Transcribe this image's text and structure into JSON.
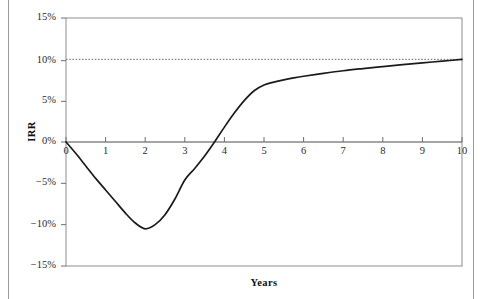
{
  "chart_data": {
    "type": "line",
    "title": "",
    "subtitle": "",
    "xlabel": "Years",
    "ylabel": "IRR",
    "xlim": [
      0,
      10
    ],
    "ylim": [
      -0.15,
      0.15
    ],
    "grid": false,
    "legend": null,
    "x_ticks": [
      0,
      1,
      2,
      3,
      4,
      5,
      6,
      7,
      8,
      9,
      10
    ],
    "x_tick_labels": [
      "0",
      "1",
      "2",
      "3",
      "4",
      "5",
      "6",
      "7",
      "8",
      "9",
      "10"
    ],
    "y_ticks": [
      0.15,
      0.1,
      0.05,
      0.0,
      -0.05,
      -0.1,
      -0.15
    ],
    "y_tick_labels": [
      "15%",
      "10%",
      "5%",
      "0%",
      "−5%",
      "−10%",
      "−15%"
    ],
    "series": [
      {
        "name": "IRR",
        "style": "solid",
        "color": "#1b1b1b",
        "x": [
          0,
          0.25,
          0.5,
          0.75,
          1,
          1.25,
          1.5,
          1.75,
          2,
          2.25,
          2.5,
          2.75,
          3,
          3.25,
          3.5,
          3.75,
          4,
          4.25,
          4.5,
          4.75,
          5,
          5.25,
          5.5,
          5.75,
          6,
          6.5,
          7,
          7.5,
          8,
          8.5,
          9,
          9.5,
          10
        ],
        "y": [
          0.0,
          -0.014,
          -0.029,
          -0.044,
          -0.058,
          -0.072,
          -0.086,
          -0.098,
          -0.105,
          -0.1,
          -0.088,
          -0.069,
          -0.046,
          -0.032,
          -0.017,
          0.0,
          0.018,
          0.035,
          0.05,
          0.062,
          0.069,
          0.0725,
          0.0752,
          0.0775,
          0.0795,
          0.083,
          0.0862,
          0.0888,
          0.0912,
          0.0935,
          0.0957,
          0.0978,
          0.1
        ]
      }
    ],
    "reference_lines": [
      {
        "name": "target-irr",
        "orientation": "horizontal",
        "value": 0.1,
        "label": "",
        "style": "dotted",
        "color": "#6e6e6e"
      },
      {
        "name": "zero-axis",
        "orientation": "horizontal",
        "value": 0.0,
        "label": "",
        "style": "solid",
        "color": "#4a4a4a"
      }
    ],
    "annotations": [],
    "colors": {
      "curve": "#1b1b1b",
      "frame": "#8d8d8d",
      "reference": "#6e6e6e",
      "text": "#1a1a1a",
      "background": "#ffffff"
    }
  }
}
